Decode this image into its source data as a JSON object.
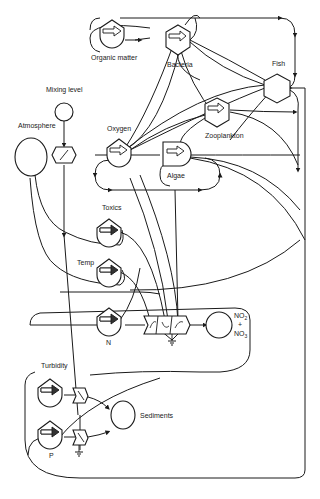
{
  "diagram": {
    "type": "energy-circuit ecosystem model",
    "nodes": {
      "organic_matter": {
        "label": "Organic matter",
        "shape": "storage-tank"
      },
      "bacteria": {
        "label": "Bacteria",
        "shape": "consumer-hexagon"
      },
      "fish": {
        "label": "Fish",
        "shape": "consumer-hexagon"
      },
      "zooplankton": {
        "label": "Zooplankton",
        "shape": "consumer-hexagon"
      },
      "mixing_level": {
        "label": "Mixing level",
        "shape": "source-circle"
      },
      "atmosphere": {
        "label": "Atmosphere",
        "shape": "source-circle"
      },
      "oxygen": {
        "label": "Oxygen",
        "shape": "storage-tank"
      },
      "algae": {
        "label": "Algae",
        "shape": "producer-bullet"
      },
      "toxics": {
        "label": "Toxics",
        "shape": "storage-tank"
      },
      "temp": {
        "label": "Temp",
        "shape": "storage-tank"
      },
      "n": {
        "label": "N",
        "shape": "storage-tank"
      },
      "no2_no3": {
        "label_line1": "NO",
        "label_sub1": "2",
        "label_plus": "+",
        "label_line2": "NO",
        "label_sub2": "3",
        "shape": "source-circle"
      },
      "turbidity": {
        "label": "Turbidity",
        "shape": "storage-tank"
      },
      "p": {
        "label": "P",
        "shape": "storage-tank"
      },
      "sediments": {
        "label": "Sediments",
        "shape": "source-circle"
      }
    }
  }
}
